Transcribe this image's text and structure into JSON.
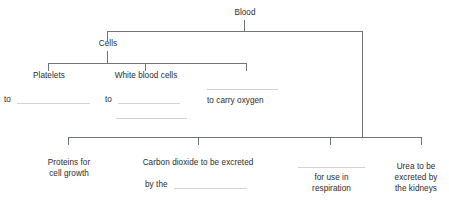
{
  "diagram": {
    "title": "Blood",
    "type": "tree-diagram-worksheet",
    "root": {
      "label": "Blood"
    },
    "branches": {
      "cells": "Cells",
      "platelets": "Platelets",
      "white_blood_cells": "White blood cells"
    },
    "function_row": {
      "platelets_function_prefix": "to",
      "white_blood_cells_function_prefix": "to",
      "red_blood_cells_function": "to carry oxygen"
    },
    "plasma_row": {
      "proteins": "Proteins for cell growth",
      "proteins_line1": "Proteins for",
      "proteins_line2": "cell growth",
      "carbon_dioxide_line1": "Carbon dioxide to be excreted",
      "carbon_dioxide_line2_prefix": "by the",
      "glucose_line1": "for use in",
      "glucose_line2": "respiration",
      "urea_line1": "Urea to be",
      "urea_line2": "excreted by",
      "urea_line3": "the kidneys"
    },
    "blanks": {
      "count": 7,
      "style": "fill-in-the-blank underline"
    },
    "colors": {
      "line": "#6e7478",
      "blank": "#cfd3d6",
      "text": "#2b2b2b",
      "background": "#ffffff"
    }
  }
}
